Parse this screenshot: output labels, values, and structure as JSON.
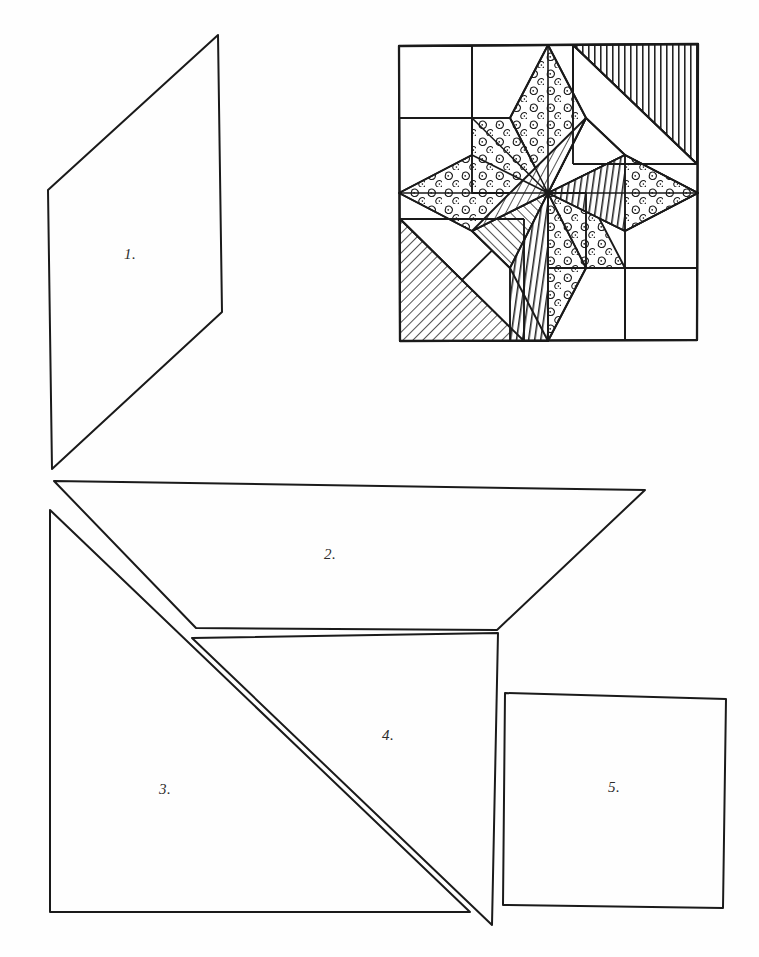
{
  "page": {
    "background_color": "#fefefe",
    "ink_color": "#1a1a1a"
  },
  "block_diagram": {
    "name": "eight-pointed-star-block",
    "outline_color": "#1a1a1a",
    "bounds": {
      "x": 398,
      "y": 45,
      "width": 300,
      "height": 296
    },
    "fabrics": [
      {
        "key": "plain",
        "label": "plain white",
        "pattern": "none"
      },
      {
        "key": "dotted",
        "label": "dotted print",
        "pattern": "circles"
      },
      {
        "key": "diag_stripe",
        "label": "diagonal stripe",
        "pattern": "diagonal-lines"
      },
      {
        "key": "vert_stripe",
        "label": "vertical stripe",
        "pattern": "vertical-lines"
      }
    ]
  },
  "pieces": [
    {
      "id": 1,
      "label": "1.",
      "shape": "parallelogram",
      "name": "piece-1-diamond"
    },
    {
      "id": 2,
      "label": "2.",
      "shape": "trapezoid",
      "name": "piece-2-trapezoid"
    },
    {
      "id": 3,
      "label": "3.",
      "shape": "triangle",
      "name": "piece-3-triangle"
    },
    {
      "id": 4,
      "label": "4.",
      "shape": "triangle",
      "name": "piece-4-triangle"
    },
    {
      "id": 5,
      "label": "5.",
      "shape": "square",
      "name": "piece-5-square"
    }
  ]
}
